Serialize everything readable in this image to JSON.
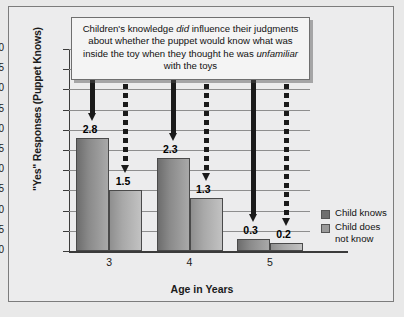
{
  "chart_data": {
    "type": "bar",
    "title": "",
    "caption": {
      "line1_a": "Children's knowledge ",
      "line1_em": "did",
      "line1_b": " influence",
      "line2": "their judgments about whether the puppet",
      "line3": "would know what was inside the toy",
      "line4_a": "when they thought he was ",
      "line4_em": "unfamiliar",
      "line4_b": " with",
      "line5": "the toys"
    },
    "xlabel": "Age in Years",
    "ylabel": "\"Yes\" Responses (Puppet Knows)",
    "categories": [
      "3",
      "4",
      "5"
    ],
    "ylim": [
      0,
      5.0
    ],
    "ytick_labels": [
      "5.0",
      "4.5",
      "4.0",
      "3.5",
      "3.0",
      "2.5",
      "2.0",
      "1.5",
      "1.0",
      "0.5",
      "0"
    ],
    "ytick_values": [
      5.0,
      4.5,
      4.0,
      3.5,
      3.0,
      2.5,
      2.0,
      1.5,
      1.0,
      0.5,
      0
    ],
    "grid": true,
    "legend_position": "right",
    "series": [
      {
        "name": "Child knows",
        "color": "#6f6f6f",
        "values": [
          2.8,
          2.3,
          0.3
        ],
        "value_labels": [
          "2.8",
          "2.3",
          "0.3"
        ]
      },
      {
        "name": "Child does not know",
        "name_line1": "Child does",
        "name_line2": "not know",
        "color": "#9a9a9a",
        "values": [
          1.5,
          1.3,
          0.2
        ],
        "value_labels": [
          "1.5",
          "1.3",
          "0.2"
        ]
      }
    ],
    "annotations": [
      {
        "type": "arrow",
        "style": "solid",
        "target_series": 0,
        "target_category": "3",
        "target_value": 2.8
      },
      {
        "type": "arrow",
        "style": "dashed",
        "target_series": 1,
        "target_category": "3",
        "target_value": 1.5
      },
      {
        "type": "arrow",
        "style": "solid",
        "target_series": 0,
        "target_category": "4",
        "target_value": 2.3
      },
      {
        "type": "arrow",
        "style": "dashed",
        "target_series": 1,
        "target_category": "4",
        "target_value": 1.3
      },
      {
        "type": "arrow",
        "style": "solid",
        "target_series": 0,
        "target_category": "5",
        "target_value": 0.3
      },
      {
        "type": "arrow",
        "style": "dashed",
        "target_series": 1,
        "target_category": "5",
        "target_value": 0.2
      }
    ]
  }
}
